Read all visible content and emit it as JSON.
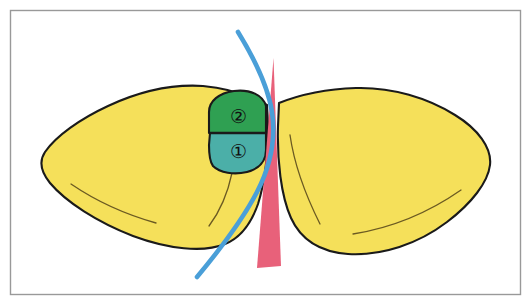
{
  "figure": {
    "canvas": {
      "width": 531,
      "height": 305,
      "background_color": "#FFFFFF"
    },
    "frame": {
      "name": "figure-border",
      "stroke_color": "#999999",
      "stroke_width": 1.4,
      "inset": 10
    },
    "palette": {
      "yellow_fill": "#F5E05A",
      "green_fill": "#2FA052",
      "teal_fill": "#4BAFA8",
      "blue_curve": "#4A9FD8",
      "pink_spike": "#E8617A",
      "outline": "#1A1A1A",
      "vein_line": "#6B5A22"
    },
    "regions": [
      {
        "id": "left-lobe",
        "label": "",
        "fill": "#F5E05A",
        "description": "left yellow lobe"
      },
      {
        "id": "right-lobe",
        "label": "",
        "fill": "#F5E05A",
        "description": "right yellow lobe"
      },
      {
        "id": "region-two",
        "label": "②",
        "label_plain": "2",
        "fill": "#2FA052",
        "description": "upper green labelled region"
      },
      {
        "id": "region-one",
        "label": "①",
        "label_plain": "1",
        "fill": "#4BAFA8",
        "description": "lower teal labelled region"
      }
    ],
    "markers": [
      {
        "id": "blue-curve",
        "color": "#4A9FD8",
        "stroke_width": 4.6,
        "description": "blue curved line sweeping from top centre to lower left"
      },
      {
        "id": "pink-spike",
        "color": "#E8617A",
        "description": "pink tapered wedge descending through the centre"
      }
    ],
    "labels": {
      "one": "①",
      "two": "②"
    }
  }
}
